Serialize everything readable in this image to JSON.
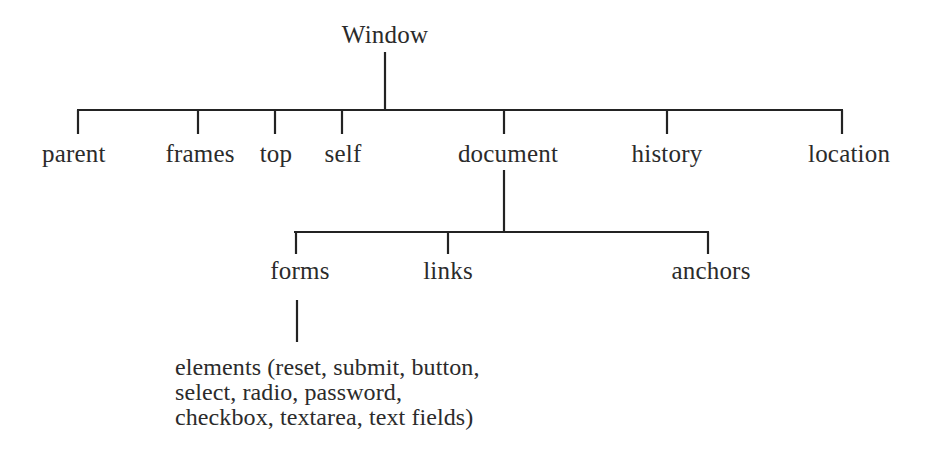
{
  "diagram": {
    "type": "tree",
    "title_node": "Window",
    "colors": {
      "line": "#232323",
      "text": "#2b2b2b",
      "background": "#ffffff"
    },
    "root": {
      "label": "Window",
      "x": 385,
      "y": 44
    },
    "level1": {
      "bar_y": 110,
      "bar_x1": 77,
      "bar_x2": 843,
      "nodes": [
        {
          "label": "parent",
          "tick_x": 77,
          "label_x": 77,
          "label_y": 160,
          "align": "left"
        },
        {
          "label": "frames",
          "tick_x": 198,
          "label_x": 198,
          "label_y": 160,
          "align": "center"
        },
        {
          "label": "top",
          "tick_x": 275,
          "label_x": 275,
          "label_y": 160,
          "align": "center"
        },
        {
          "label": "self",
          "tick_x": 342,
          "label_x": 342,
          "label_y": 160,
          "align": "center"
        },
        {
          "label": "document",
          "tick_x": 504,
          "label_x": 504,
          "label_y": 160,
          "align": "center"
        },
        {
          "label": "history",
          "tick_x": 667,
          "label_x": 667,
          "label_y": 160,
          "align": "center"
        },
        {
          "label": "location",
          "tick_x": 843,
          "label_x": 843,
          "label_y": 160,
          "align": "right"
        }
      ]
    },
    "level2": {
      "parent_label": "document",
      "bar_y": 232,
      "bar_x1": 294,
      "bar_x2": 709,
      "stem_x": 504,
      "nodes": [
        {
          "label": "forms",
          "tick_x": 298,
          "label_x": 298,
          "label_y": 280,
          "align": "center"
        },
        {
          "label": "links",
          "tick_x": 448,
          "label_x": 448,
          "label_y": 280,
          "align": "center"
        },
        {
          "label": "anchors",
          "tick_x": 709,
          "label_x": 709,
          "label_y": 280,
          "align": "right"
        }
      ]
    },
    "level3": {
      "parent_label": "forms",
      "stem_x": 298,
      "stem_y1": 300,
      "stem_y2": 342,
      "leaf": {
        "x": 175,
        "y": 356,
        "lines": [
          "elements (reset, submit, button,",
          "select, radio, password,",
          "checkbox, textarea, text fields)"
        ],
        "full_text": "elements (reset, submit, button, select, radio, password, checkbox, textarea, text fields)"
      }
    }
  }
}
